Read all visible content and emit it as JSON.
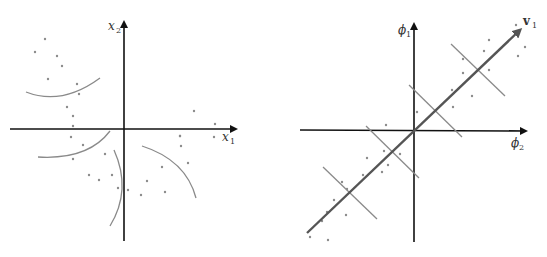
{
  "left_panel": {
    "description": "Data in the original x1-x2 space with curved decision boundaries",
    "x_axis_label": "x",
    "x_axis_sub": "1",
    "y_axis_label": "x",
    "y_axis_sub": "2",
    "points": [
      [
        45,
        39
      ],
      [
        35,
        52
      ],
      [
        57,
        56
      ],
      [
        62,
        66
      ],
      [
        48,
        79
      ],
      [
        77,
        84
      ],
      [
        79,
        94
      ],
      [
        67,
        107
      ],
      [
        73,
        116
      ],
      [
        73,
        126
      ],
      [
        71,
        137
      ],
      [
        83,
        145
      ],
      [
        105,
        154
      ],
      [
        73,
        159
      ],
      [
        89,
        175
      ],
      [
        99,
        180
      ],
      [
        112,
        175
      ],
      [
        118,
        188
      ],
      [
        128,
        190
      ],
      [
        141,
        195
      ],
      [
        147,
        181
      ],
      [
        165,
        192
      ],
      [
        162,
        167
      ],
      [
        181,
        146
      ],
      [
        180,
        136
      ],
      [
        180,
        136
      ],
      [
        188,
        163
      ],
      [
        194,
        111
      ],
      [
        215,
        124
      ],
      [
        214,
        137
      ]
    ]
  },
  "right_panel": {
    "description": "Data in feature space phi1-phi2 with principal direction v1 and linear boundaries",
    "x_axis_label": "ϕ",
    "x_axis_sub": "2",
    "y_axis_label": "ϕ",
    "y_axis_sub": "1",
    "vector_label": "v",
    "vector_sub": "1",
    "points": [
      [
        516,
        25
      ],
      [
        489,
        40
      ],
      [
        484,
        51
      ],
      [
        525,
        47
      ],
      [
        518,
        56
      ],
      [
        463,
        59
      ],
      [
        463,
        73
      ],
      [
        489,
        70
      ],
      [
        452,
        90
      ],
      [
        472,
        96
      ],
      [
        453,
        107
      ],
      [
        417,
        112
      ],
      [
        386,
        125
      ],
      [
        384,
        151
      ],
      [
        400,
        154
      ],
      [
        367,
        158
      ],
      [
        388,
        165
      ],
      [
        382,
        172
      ],
      [
        363,
        175
      ],
      [
        342,
        182
      ],
      [
        347,
        189
      ],
      [
        334,
        200
      ],
      [
        327,
        212
      ],
      [
        346,
        215
      ],
      [
        322,
        221
      ],
      [
        310,
        237
      ],
      [
        328,
        240
      ]
    ]
  },
  "colors": {
    "axis": "#111111",
    "boundary": "#8a8a8a",
    "points": "#8c8c8c",
    "vector": "#555555"
  }
}
